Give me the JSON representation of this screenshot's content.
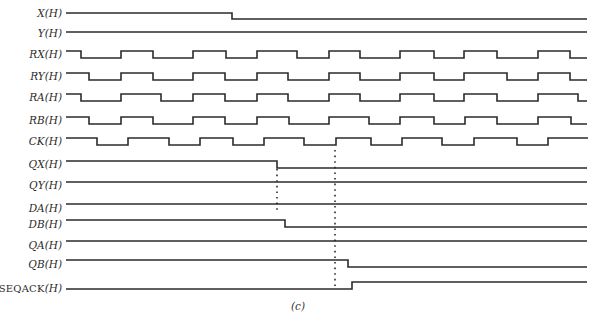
{
  "figure": {
    "caption": "(c)",
    "line_color": "#2b2b2b",
    "dotted_color": "#2b2b2b"
  },
  "signals": [
    {
      "id": "X",
      "label": "X(H)",
      "y_high": 13,
      "swing": 6,
      "start_level": 1,
      "x_start": 66,
      "x_end": 587,
      "edges": [
        232
      ]
    },
    {
      "id": "Y",
      "label": "Y(H)",
      "y_high": 32,
      "swing": 6,
      "start_level": 1,
      "x_start": 66,
      "x_end": 587,
      "edges": []
    },
    {
      "id": "RX",
      "label": "RX(H)",
      "y_high": 51,
      "swing": 7,
      "start_level": 1,
      "x_start": 66,
      "x_end": 587,
      "edges": [
        81,
        121,
        153,
        193,
        226,
        257,
        297,
        329,
        360,
        400,
        434,
        464,
        497,
        538,
        570
      ]
    },
    {
      "id": "RY",
      "label": "RY(H)",
      "y_high": 73,
      "swing": 7,
      "start_level": 1,
      "x_start": 66,
      "x_end": 587,
      "edges": [
        89,
        121,
        153,
        193,
        225,
        257,
        288,
        329,
        360,
        400,
        434,
        464,
        507,
        538,
        570
      ]
    },
    {
      "id": "RA",
      "label": "RA(H)",
      "y_high": 94,
      "swing": 7,
      "start_level": 1,
      "x_start": 66,
      "x_end": 587,
      "edges": [
        81,
        121,
        161,
        193,
        225,
        257,
        288,
        329,
        360,
        400,
        434,
        464,
        497,
        538,
        578
      ]
    },
    {
      "id": "RB",
      "label": "RB(H)",
      "y_high": 117,
      "swing": 7,
      "start_level": 1,
      "x_start": 66,
      "x_end": 587,
      "edges": [
        89,
        121,
        153,
        193,
        225,
        257,
        289,
        329,
        369,
        400,
        434,
        465,
        497,
        538,
        571
      ]
    },
    {
      "id": "CK",
      "label": "CK(H)",
      "y_high": 138,
      "swing": 7,
      "start_level": 1,
      "x_start": 66,
      "x_end": 588,
      "edges": [
        97,
        128,
        169,
        200,
        233,
        264,
        304,
        336,
        371,
        402,
        442,
        474,
        517,
        548
      ]
    },
    {
      "id": "QX",
      "label": "QX(H)",
      "y_high": 161,
      "swing": 7,
      "start_level": 1,
      "x_start": 66,
      "x_end": 587,
      "edges": [
        277
      ]
    },
    {
      "id": "QY",
      "label": "QY(H)",
      "y_high": 182,
      "swing": 7,
      "start_level": 1,
      "x_start": 66,
      "x_end": 587,
      "edges": []
    },
    {
      "id": "DA",
      "label": "DA(H)",
      "y_high": 204,
      "swing": 7,
      "start_level": 1,
      "x_start": 66,
      "x_end": 587,
      "edges": []
    },
    {
      "id": "DB",
      "label": "DB(H)",
      "y_high": 220,
      "swing": 7,
      "start_level": 1,
      "x_start": 66,
      "x_end": 587,
      "edges": [
        285
      ]
    },
    {
      "id": "QA",
      "label": "QA(H)",
      "y_high": 241,
      "swing": 7,
      "start_level": 1,
      "x_start": 66,
      "x_end": 587,
      "edges": []
    },
    {
      "id": "QB",
      "label": "QB(H)",
      "y_high": 260,
      "swing": 7,
      "start_level": 1,
      "x_start": 66,
      "x_end": 587,
      "edges": [
        348
      ]
    },
    {
      "id": "SEQACK",
      "label_plain": "SEQACK",
      "label_italic": "(H)",
      "y_high": 282,
      "swing": 7,
      "start_level": 0,
      "x_start": 66,
      "x_end": 587,
      "edges": [
        352
      ]
    }
  ],
  "markers": [
    {
      "id": "marker-qx-fall",
      "x": 277,
      "y1": 169,
      "y2": 212
    },
    {
      "id": "marker-ck-rise",
      "x": 335,
      "y1": 150,
      "y2": 290
    }
  ]
}
